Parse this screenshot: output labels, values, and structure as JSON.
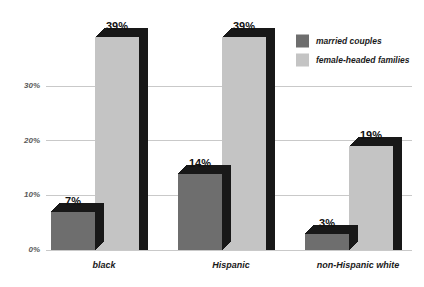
{
  "chart_data": {
    "type": "bar",
    "title": "",
    "subtitle": "",
    "xlabel": "",
    "ylabel": "",
    "categories": [
      "black",
      "Hispanic",
      "non-Hispanic white"
    ],
    "series": [
      {
        "name": "married couples",
        "color": "#6e6e6e",
        "values": [
          7,
          14,
          3
        ],
        "value_labels": [
          "7%",
          "14%",
          "3%"
        ]
      },
      {
        "name": "female-headed families",
        "color": "#c4c4c4",
        "values": [
          39,
          39,
          19
        ],
        "value_labels": [
          "39%",
          "39%",
          "19%"
        ]
      }
    ],
    "ylim": [
      0,
      39
    ],
    "yticks": [
      0,
      10,
      20,
      30
    ],
    "ytick_labels": [
      "0%",
      "10%",
      "20%",
      "30%"
    ],
    "grid": true,
    "grid_color": "#c9c9c9",
    "legend_position": "top-right",
    "depth_color": "#181818",
    "background": "#ffffff"
  },
  "legend": {
    "items": [
      {
        "label": "married couples",
        "swatch": "#6e6e6e"
      },
      {
        "label": "female-headed families",
        "swatch": "#c4c4c4"
      }
    ]
  },
  "axis": {
    "tick_labels": [
      "30%",
      "20%",
      "10%",
      "0%"
    ]
  }
}
